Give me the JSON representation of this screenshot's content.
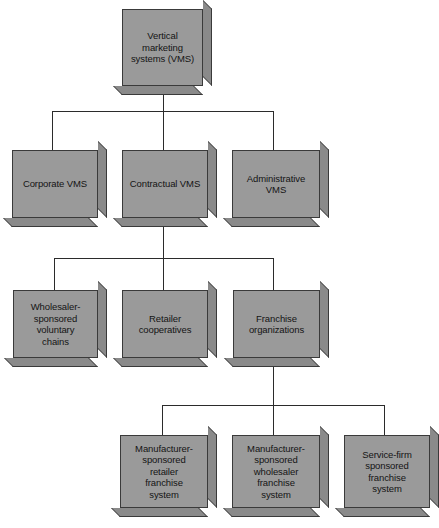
{
  "diagram": {
    "colors": {
      "box_face": "#9a9a9a",
      "box_side": "#8a8a8a",
      "box_border": "#3a3a3a",
      "connector": "#2b2b2b",
      "background": "#ffffff",
      "text": "#141414"
    },
    "nodes": {
      "root": {
        "label": "Vertical\nmarketing\nsystems (VMS)"
      },
      "level2": [
        {
          "label": "Corporate VMS"
        },
        {
          "label": "Contractual VMS"
        },
        {
          "label": "Administrative VMS"
        }
      ],
      "level3": [
        {
          "label": "Wholesaler-\nsponsored\nvoluntary\nchains"
        },
        {
          "label": "Retailer\ncooperatives"
        },
        {
          "label": "Franchise\norganizations"
        }
      ],
      "level4": [
        {
          "label": "Manufacturer-\nsponsored\nretailer\nfranchise\nsystem"
        },
        {
          "label": "Manufacturer-\nsponsored\nwholesaler\nfranchise\nsystem"
        },
        {
          "label": "Service-firm\nsponsored\nfranchise\nsystem"
        }
      ]
    }
  }
}
